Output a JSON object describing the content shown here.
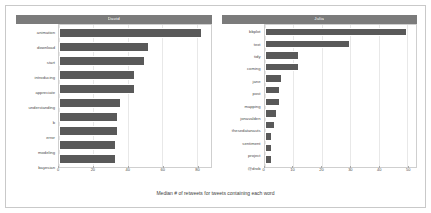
{
  "figure": {
    "outer_background": "#ffffff",
    "frame_border_color": "#c9c9c9",
    "panel_background": "#ffffff",
    "grid_color": "#e8e8e8",
    "bar_color": "#595959",
    "strip_background": "#7b7b7b",
    "strip_text_color": "#ffffff",
    "axis_text_color": "#4d4d4d"
  },
  "chart_data": {
    "type": "bar",
    "orientation": "horizontal",
    "title": "",
    "subtitle": "",
    "xlabel": "Median # of retweets for tweets containing each word",
    "ylabel": "",
    "grid": true,
    "legend": "none",
    "facet_layout": "1 row x 2 columns",
    "panels": [
      {
        "strip_label": "David",
        "xlim": [
          0,
          88
        ],
        "xticks": [
          0,
          20,
          40,
          60,
          80
        ],
        "xticklabels": [
          "0",
          "20",
          "40",
          "60",
          "80"
        ],
        "categories": [
          "animation",
          "download",
          "start",
          "introducing",
          "appreciate",
          "understanding",
          "b",
          "error",
          "modeling",
          "bayesian"
        ],
        "values": [
          83,
          52,
          50,
          44,
          44,
          36,
          34,
          34,
          33,
          33
        ]
      },
      {
        "strip_label": "Julia",
        "xlim": [
          0,
          53
        ],
        "xticks": [
          0,
          10,
          20,
          30,
          40,
          50
        ],
        "xticklabels": [
          "0",
          "10",
          "20",
          "30",
          "40",
          "50"
        ],
        "categories": [
          "bbplot",
          "text",
          "tidy",
          "coming",
          "jane",
          "post",
          "mapping",
          "jonavalden",
          "thesedatanauts",
          "sentiment",
          "project",
          "@drob"
        ],
        "values": [
          50,
          30,
          12,
          12,
          6,
          5.5,
          5.5,
          4.5,
          3.5,
          2.5,
          2.5,
          2.5
        ]
      }
    ]
  }
}
